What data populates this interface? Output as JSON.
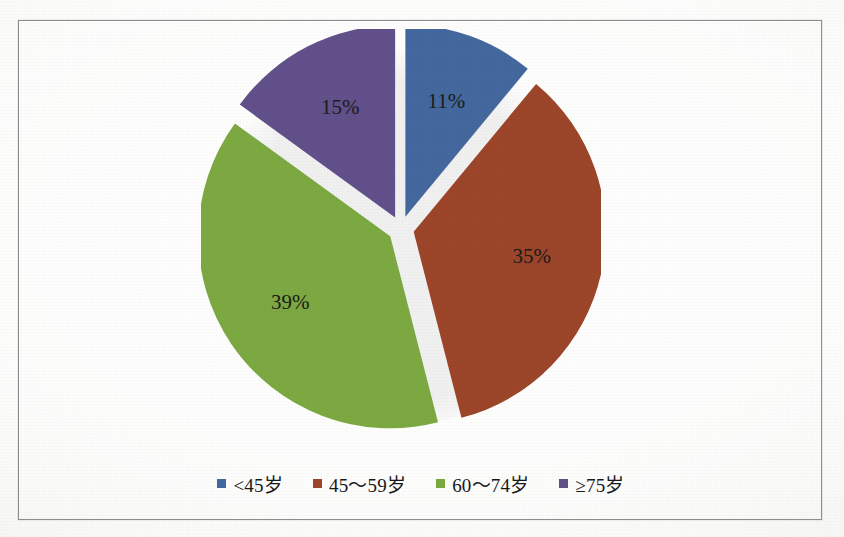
{
  "chart_data": {
    "type": "pie",
    "title": "",
    "subtitle": "",
    "xlabel": "",
    "ylabel": "",
    "categories": [
      "<45岁",
      "45～59岁",
      "60～74岁",
      "≥75岁"
    ],
    "values": [
      11,
      35,
      39,
      15
    ],
    "value_unit": "%",
    "data_labels": [
      "11%",
      "35%",
      "39%",
      "15%"
    ],
    "colors": [
      "#44689E",
      "#9C4529",
      "#7CA942",
      "#61508A"
    ],
    "legend_position": "bottom",
    "grid": false,
    "exploded": true,
    "start_angle_deg": 0,
    "direction": "clockwise",
    "series": [
      {
        "name": "年龄构成",
        "slices": [
          {
            "label": "<45岁",
            "value": 11,
            "data_label": "11%",
            "color": "#44689E"
          },
          {
            "label": "45～59岁",
            "value": 35,
            "data_label": "35%",
            "color": "#9C4529"
          },
          {
            "label": "60～74岁",
            "value": 39,
            "data_label": "39%",
            "color": "#7CA942"
          },
          {
            "label": "≥75岁",
            "value": 15,
            "data_label": "15%",
            "color": "#61508A"
          }
        ]
      }
    ]
  },
  "legend": {
    "items": [
      {
        "label": "<45岁",
        "color": "#44689E"
      },
      {
        "label": "45～59岁",
        "color": "#9C4529"
      },
      {
        "label": "60～74岁",
        "color": "#7CA942"
      },
      {
        "label": "≥75岁",
        "color": "#61508A"
      }
    ]
  },
  "labels": {
    "blue": "11%",
    "red": "35%",
    "green": "39%",
    "purple": "15%"
  },
  "colors": {
    "blue": "#44689E",
    "red": "#9C4529",
    "green": "#7CA942",
    "purple": "#61508A",
    "frame_border": "#8d8f8e",
    "page_background": "#fdfdfc",
    "label_text": "#1b1b1b"
  }
}
